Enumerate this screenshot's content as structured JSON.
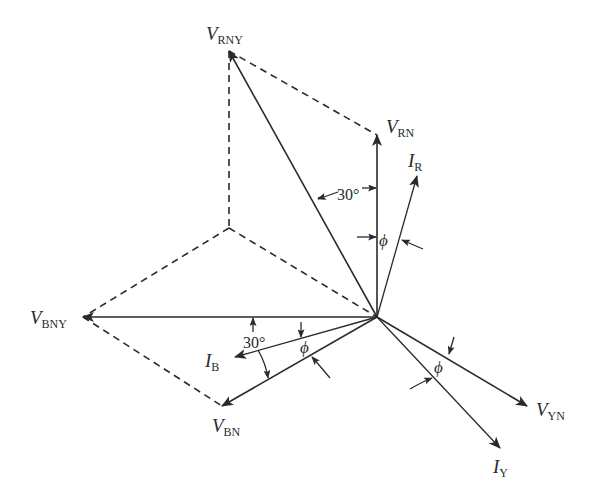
{
  "diagram": {
    "colors": {
      "ink": "#2a2a2a",
      "background": "#ffffff"
    },
    "origin": [
      377,
      317
    ],
    "phasors": [
      {
        "id": "V_RN",
        "main": "V",
        "sub": "RN",
        "tip": [
          377,
          135
        ],
        "label_pos": [
          386,
          133
        ]
      },
      {
        "id": "V_YN",
        "main": "V",
        "sub": "YN",
        "tip": [
          527,
          406
        ],
        "label_pos": [
          536,
          416
        ]
      },
      {
        "id": "V_BN",
        "main": "V",
        "sub": "BN",
        "tip": [
          222,
          406
        ],
        "label_pos": [
          212,
          432
        ]
      },
      {
        "id": "V_RNY",
        "main": "V",
        "sub": "RNY",
        "tip": [
          229,
          51
        ],
        "label_pos": [
          206,
          40
        ]
      },
      {
        "id": "V_BNY",
        "main": "V",
        "sub": "BNY",
        "tip": [
          83,
          317
        ],
        "label_pos": [
          30,
          324
        ]
      },
      {
        "id": "I_R",
        "main": "I",
        "sub": "R",
        "tip": [
          417,
          176
        ],
        "label_pos": [
          408,
          167
        ]
      },
      {
        "id": "I_Y",
        "main": "I",
        "sub": "Y",
        "tip": [
          500,
          448
        ],
        "label_pos": [
          493,
          473
        ]
      },
      {
        "id": "I_B",
        "main": "I",
        "sub": "B",
        "tip": [
          235,
          357
        ],
        "label_pos": [
          205,
          367
        ]
      }
    ],
    "angle_labels": {
      "top_30": "30°",
      "left_30": "30°",
      "phi_R": "ϕ",
      "phi_B": "ϕ",
      "phi_Y": "ϕ"
    }
  }
}
